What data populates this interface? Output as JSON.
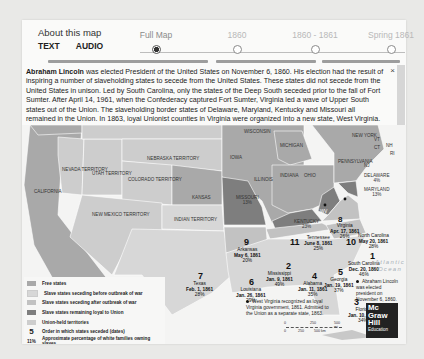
{
  "header": {
    "about_label": "About this map",
    "modes": [
      {
        "label": "TEXT",
        "active": true
      },
      {
        "label": "AUDIO",
        "active": false
      }
    ]
  },
  "timeline": {
    "stops": [
      {
        "label": "Full Map",
        "selected": true
      },
      {
        "label": "1860",
        "selected": false
      },
      {
        "label": "1860 - 1861",
        "selected": false
      },
      {
        "label": "Spring 1861",
        "selected": false
      }
    ]
  },
  "info": {
    "lead": "Abraham Lincoln",
    "body": " was elected President of the United States on November 6, 1860. His election had the result of inspiring a number of slaveholding states to secede from the United States. These states did not secede from the United States in unison. Led by South Carolina, only the states of the Deep South seceded prior to the fall of Fort Sumter. After April 14, 1961, when the Confederacy captured Fort Sumter, Virginia led a wave of Upper South states out of the Union. The slaveholding border states of Delaware, Maryland, Kentucky and Missouri all remained in the Union. In 1863, loyal Unionist counties in Virginia were organized into a new state, West Virginia.",
    "close_icon": "×"
  },
  "map": {
    "colors": {
      "free": "#a9a9a9",
      "slave_before": "#d7d7d7",
      "slave_after": "#c2c2c2",
      "slave_loyal": "#7e7e7e",
      "union_territory": "#cdcdcd",
      "water": "#f4f4f3"
    },
    "territory_labels": {
      "nevada": "Nevada Territory",
      "utah": "Utah Territory",
      "nebraska": "Nebraska Territory",
      "colorado": "Colorado Territory",
      "new_mexico": "New Mexico Territory",
      "indian": "Indian Territory"
    },
    "state_labels": {
      "california": "California",
      "kansas": "Kansas",
      "wisconsin": "Wisconsin",
      "michigan": "Michigan",
      "iowa": "Iowa",
      "illinois": "Illinois",
      "indiana": "Indiana",
      "ohio": "Ohio",
      "new_york": "New York",
      "pennsylvania": "Pennsylvania",
      "vt": "VT",
      "nh": "NH",
      "ct": "CT",
      "ri": "RI",
      "nj": "NJ"
    },
    "border_states": [
      {
        "name": "Missouri",
        "pct": "13%"
      },
      {
        "name": "Kentucky",
        "pct": "23%"
      },
      {
        "name": "Delaware",
        "pct": "4%"
      },
      {
        "name": "Maryland",
        "pct": "13%"
      },
      {
        "name": "WV",
        "pct": ""
      }
    ],
    "seceded_states": [
      {
        "order": "1",
        "name": "South Carolina",
        "date": "Dec. 20, 1860",
        "pct": "46%"
      },
      {
        "order": "2",
        "name": "Mississippi",
        "date": "Jan. 9, 1861",
        "pct": "49%"
      },
      {
        "order": "3",
        "name": "Florida",
        "date": "Jan. 10, 1861",
        "pct": "34%"
      },
      {
        "order": "4",
        "name": "Alabama",
        "date": "Jan. 11, 1861",
        "pct": "35%"
      },
      {
        "order": "5",
        "name": "Georgia",
        "date": "Jan. 19, 1861",
        "pct": "37%"
      },
      {
        "order": "6",
        "name": "Louisiana",
        "date": "Jan. 26, 1861",
        "pct": "29%"
      },
      {
        "order": "7",
        "name": "Texas",
        "date": "Feb. 1, 1861",
        "pct": "28%"
      },
      {
        "order": "8",
        "name": "Virginia",
        "date": "Apr. 17, 1861",
        "pct": "26%"
      },
      {
        "order": "9",
        "name": "Arkansas",
        "date": "May 6, 1861",
        "pct": "20%"
      },
      {
        "order": "10",
        "name": "North Carolina",
        "date": "May 20, 1861",
        "pct": "28%"
      },
      {
        "order": "11",
        "name": "Tennessee",
        "date": "June 8, 1861",
        "pct": "25%"
      }
    ],
    "ocean_label": "Atlantic Ocean",
    "notes": {
      "lincoln": "Abraham Lincoln was elected president on November 6, 1860.",
      "west_virginia": "West Virginia recognized as loyal Virginia government, 1861. Admitted to the Union as a separate state, 1863."
    },
    "scale": {
      "miles": [
        "0",
        "250",
        "500 mi"
      ],
      "km": [
        "0",
        "250",
        "500 km"
      ]
    }
  },
  "legend": {
    "items": [
      {
        "type": "swatch",
        "color": "#a9a9a9",
        "label": "Free states"
      },
      {
        "type": "swatch",
        "color": "#d7d7d7",
        "label": "Slave states seceding before outbreak of war"
      },
      {
        "type": "swatch",
        "color": "#c2c2c2",
        "label": "Slave states seceding after outbreak of war"
      },
      {
        "type": "swatch",
        "color": "#7e7e7e",
        "label": "Slave states remaining loyal to Union"
      },
      {
        "type": "swatch",
        "color": "#cdcdcd",
        "label": "Union-held territories"
      },
      {
        "type": "number",
        "symbol": "5",
        "label": "Order in which states seceded (dates)"
      },
      {
        "type": "percent",
        "symbol": "11%",
        "label": "Approximate percentage of white families owning slaves"
      }
    ]
  },
  "logo": {
    "lines": [
      "Mc",
      "Graw",
      "Hill"
    ],
    "sub": "Education"
  }
}
